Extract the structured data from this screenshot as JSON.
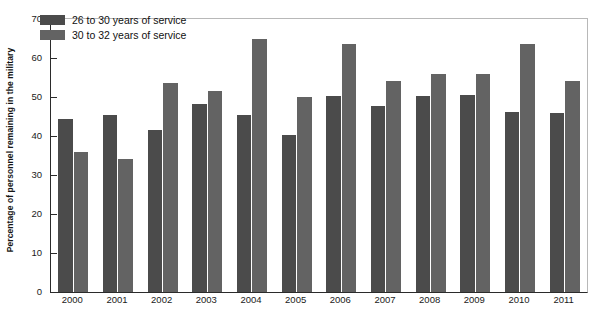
{
  "chart_data": {
    "type": "bar",
    "title": "",
    "xlabel": "",
    "ylabel": "Percentage of personnel remaining in the military",
    "ylim": [
      0,
      70
    ],
    "yticks": [
      0,
      10,
      20,
      30,
      40,
      50,
      60,
      70
    ],
    "grid": false,
    "legend_position": "top-left",
    "categories": [
      "2000",
      "2001",
      "2002",
      "2003",
      "2004",
      "2005",
      "2006",
      "2007",
      "2008",
      "2009",
      "2010",
      "2011"
    ],
    "series": [
      {
        "name": "26 to 30 years of service",
        "color": "#4b4b4b",
        "values": [
          44.4,
          45.3,
          41.5,
          48.3,
          45.3,
          40.2,
          50.3,
          47.8,
          50.3,
          50.5,
          46.2,
          46.0
        ]
      },
      {
        "name": "30 to 32 years of service",
        "color": "#636363",
        "values": [
          35.9,
          34.2,
          53.5,
          51.5,
          65.0,
          50.0,
          63.5,
          54.0,
          56.0,
          56.0,
          63.5,
          54.0
        ]
      }
    ]
  },
  "axis": {
    "y_title": "Percentage of personnel remaining in the military",
    "y_tick_labels": [
      "70",
      "60",
      "50",
      "40",
      "30",
      "20",
      "10",
      "0"
    ],
    "x_tick_labels": [
      "2000",
      "2001",
      "2002",
      "2003",
      "2004",
      "2005",
      "2006",
      "2007",
      "2008",
      "2009",
      "2010",
      "2011"
    ]
  },
  "legend": {
    "items": [
      {
        "label": "26 to 30 years of service",
        "color": "#4b4b4b"
      },
      {
        "label": "30 to 32 years of service",
        "color": "#636363"
      }
    ]
  }
}
